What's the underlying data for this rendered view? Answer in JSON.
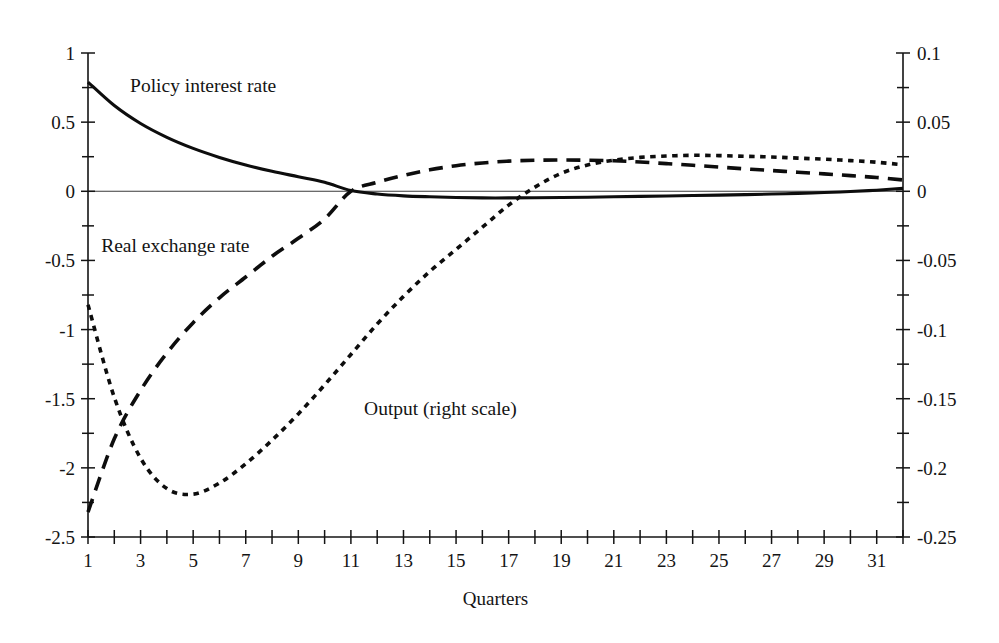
{
  "chart_data": {
    "type": "line",
    "title": "",
    "xlabel": "Quarters",
    "ylabel": "",
    "y2label": "",
    "xlim": [
      1,
      32
    ],
    "ylim": [
      -2.5,
      1
    ],
    "y2lim": [
      -0.25,
      0.1
    ],
    "grid": false,
    "legend_position": "inline-annotations",
    "x": [
      1,
      2,
      3,
      4,
      5,
      6,
      7,
      8,
      9,
      10,
      11,
      12,
      13,
      14,
      15,
      16,
      17,
      18,
      19,
      20,
      21,
      22,
      23,
      24,
      25,
      26,
      27,
      28,
      29,
      30,
      31,
      32
    ],
    "xticks_major": [
      1,
      3,
      5,
      7,
      9,
      11,
      13,
      15,
      17,
      19,
      21,
      23,
      25,
      27,
      29,
      31
    ],
    "xtick_labels": [
      "1",
      "3",
      "5",
      "7",
      "9",
      "11",
      "13",
      "15",
      "17",
      "19",
      "21",
      "23",
      "25",
      "27",
      "29",
      "31"
    ],
    "yticks_major": [
      1,
      0.5,
      0,
      -0.5,
      -1,
      -1.5,
      -2,
      -2.5
    ],
    "ytick_labels": [
      "1",
      "0.5",
      "0",
      "-0.5",
      "-1",
      "-1.5",
      "-2",
      "-2.5"
    ],
    "yticks_minor": [
      0.75,
      0.25,
      -0.25,
      -0.75,
      -1.25,
      -1.75,
      -2.25
    ],
    "y2ticks_major": [
      0.1,
      0.05,
      0,
      -0.05,
      -0.1,
      -0.15,
      -0.2,
      -0.25
    ],
    "y2tick_labels": [
      "0.1",
      "0.05",
      "0",
      "-0.05",
      "-0.1",
      "-0.15",
      "-0.2",
      "-0.25"
    ],
    "y2ticks_minor": [
      0.075,
      0.025,
      -0.025,
      -0.075,
      -0.125,
      -0.175,
      -0.225
    ],
    "series": [
      {
        "name": "Policy interest rate",
        "label": "Policy interest rate",
        "axis": "left",
        "style": "solid",
        "values": [
          0.79,
          0.62,
          0.49,
          0.39,
          0.31,
          0.245,
          0.19,
          0.145,
          0.105,
          0.065,
          0.005,
          -0.02,
          -0.033,
          -0.04,
          -0.045,
          -0.048,
          -0.048,
          -0.047,
          -0.045,
          -0.043,
          -0.04,
          -0.037,
          -0.034,
          -0.031,
          -0.028,
          -0.024,
          -0.02,
          -0.015,
          -0.009,
          -0.002,
          0.008,
          0.021
        ]
      },
      {
        "name": "Real exchange rate",
        "label": "Real exchange rate",
        "axis": "left",
        "style": "dashed",
        "values": [
          -2.32,
          -1.79,
          -1.44,
          -1.17,
          -0.95,
          -0.77,
          -0.62,
          -0.47,
          -0.34,
          -0.2,
          0.0,
          0.065,
          0.115,
          0.155,
          0.185,
          0.205,
          0.218,
          0.224,
          0.226,
          0.225,
          0.221,
          0.212,
          0.2,
          0.188,
          0.175,
          0.162,
          0.15,
          0.138,
          0.126,
          0.113,
          0.1,
          0.082
        ]
      },
      {
        "name": "Output (right scale)",
        "label": "Output (right scale)",
        "axis": "right",
        "style": "dotted",
        "values": [
          -0.082,
          -0.149,
          -0.193,
          -0.215,
          -0.219,
          -0.211,
          -0.197,
          -0.18,
          -0.161,
          -0.14,
          -0.118,
          -0.096,
          -0.076,
          -0.058,
          -0.042,
          -0.026,
          -0.01,
          0.003,
          0.013,
          0.019,
          0.0225,
          0.0245,
          0.0255,
          0.026,
          0.0258,
          0.0253,
          0.0248,
          0.024,
          0.0232,
          0.0222,
          0.021,
          0.0192
        ]
      }
    ],
    "annotations": [
      {
        "text": "Policy interest rate",
        "x": 2.6,
        "y_left": 0.72
      },
      {
        "text": "Real exchange rate",
        "x": 1.5,
        "y_left": -0.44
      },
      {
        "text": "Output (right scale)",
        "x": 11.5,
        "y_left": -1.62
      }
    ]
  }
}
